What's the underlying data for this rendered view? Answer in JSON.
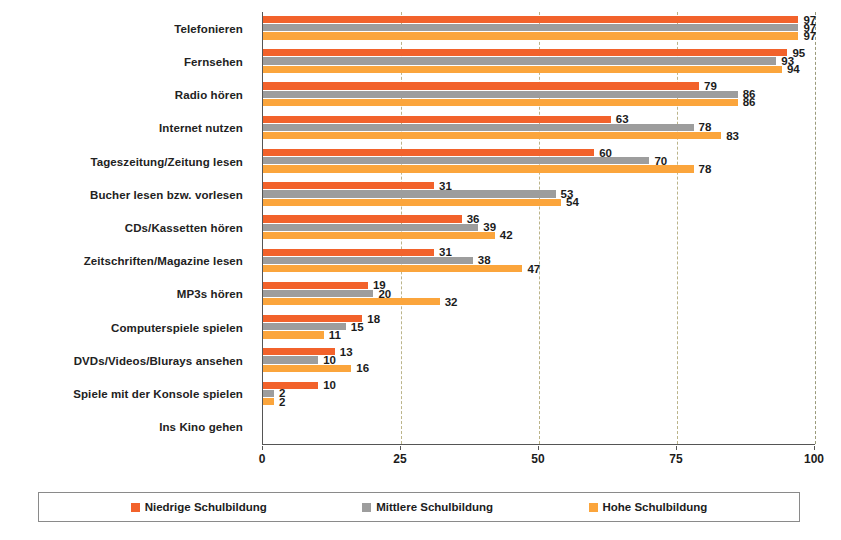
{
  "chart_data": {
    "type": "bar",
    "orientation": "horizontal",
    "title": "",
    "subtitle": "",
    "xlabel": "",
    "ylabel": "",
    "xlim": [
      0,
      100
    ],
    "xticks": [
      0,
      25,
      50,
      75,
      100
    ],
    "xtick_labels": [
      "0",
      "25",
      "50",
      "75",
      "100"
    ],
    "grid": "vertical-dashed",
    "legend_position": "bottom",
    "categories": [
      "Telefonieren",
      "Fernsehen",
      "Radio hören",
      "Internet nutzen",
      "Tageszeitung/Zeitung lesen",
      "Bucher lesen bzw. vorlesen",
      "CDs/Kassetten hören",
      "Zeitschriften/Magazine lesen",
      "MP3s hören",
      "Computerspiele spielen",
      "DVDs/Videos/Blurays ansehen",
      "Spiele mit der Konsole spielen",
      "Ins Kino gehen"
    ],
    "series": [
      {
        "name": "Niedrige Schulbildung",
        "color": "#f2622b",
        "values": [
          97,
          95,
          79,
          63,
          60,
          31,
          36,
          31,
          19,
          18,
          13,
          10,
          0
        ]
      },
      {
        "name": "Mittlere Schulbildung",
        "color": "#9d9d9d",
        "values": [
          97,
          93,
          86,
          78,
          70,
          53,
          39,
          38,
          20,
          15,
          10,
          2,
          0
        ]
      },
      {
        "name": "Hohe Schulbildung",
        "color": "#fba53c",
        "values": [
          97,
          94,
          86,
          83,
          78,
          54,
          42,
          47,
          32,
          11,
          16,
          2,
          0
        ]
      }
    ]
  },
  "legend": {
    "items": [
      {
        "label": "Niedrige Schulbildung",
        "color": "#f2622b"
      },
      {
        "label": "Mittlere Schulbildung",
        "color": "#9d9d9d"
      },
      {
        "label": "Hohe Schulbildung",
        "color": "#fba53c"
      }
    ]
  },
  "axis": {
    "x_tick_labels": [
      "0",
      "25",
      "50",
      "75",
      "100"
    ]
  }
}
